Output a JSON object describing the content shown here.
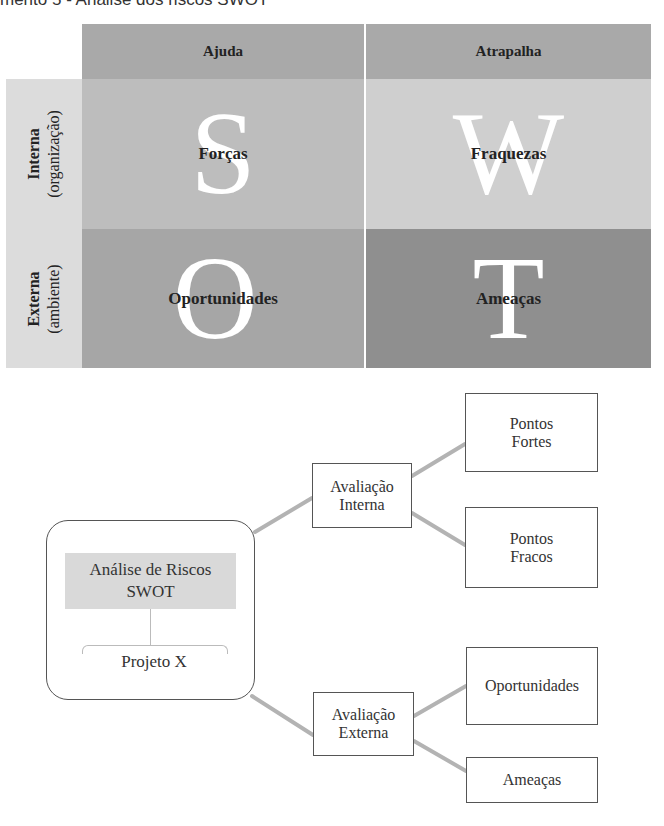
{
  "caption": "mento 5 - Análise dos riscos SWOT",
  "swot_matrix": {
    "column_headers": [
      "Ajuda",
      "Atrapalha"
    ],
    "row_headers": [
      {
        "main": "Interna",
        "sub": "(organização)"
      },
      {
        "main": "Externa",
        "sub": "(ambiente)"
      }
    ],
    "cells": [
      {
        "letter": "S",
        "label": "Forças",
        "color": "#bdbdbd"
      },
      {
        "letter": "W",
        "label": "Fraquezas",
        "color": "#cfcfcf"
      },
      {
        "letter": "O",
        "label": "Oportunidades",
        "color": "#a6a6a6"
      },
      {
        "letter": "T",
        "label": "Ameaças",
        "color": "#8f8f8f"
      }
    ]
  },
  "diagram": {
    "root": {
      "title_line1": "Análise de Riscos",
      "title_line2": "SWOT",
      "subtitle": "Projeto X"
    },
    "internal": {
      "label_line1": "Avaliação",
      "label_line2": "Interna",
      "children": [
        {
          "line1": "Pontos",
          "line2": "Fortes"
        },
        {
          "line1": "Pontos",
          "line2": "Fracos"
        }
      ]
    },
    "external": {
      "label_line1": "Avaliação",
      "label_line2": "Externa",
      "children": [
        {
          "line1": "Oportunidades",
          "line2": ""
        },
        {
          "line1": "Ameaças",
          "line2": ""
        }
      ]
    }
  }
}
